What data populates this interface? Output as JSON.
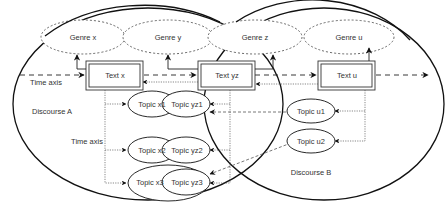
{
  "diagram": {
    "discourses": [
      {
        "id": "A",
        "label": "Discourse A"
      },
      {
        "id": "B",
        "label": "Discourse B"
      }
    ],
    "genres": [
      {
        "id": "x",
        "label": "Genre x"
      },
      {
        "id": "y",
        "label": "Genre y"
      },
      {
        "id": "z",
        "label": "Genre z"
      },
      {
        "id": "u",
        "label": "Genre u"
      }
    ],
    "texts": [
      {
        "id": "x",
        "label": "Text x"
      },
      {
        "id": "yz",
        "label": "Text yz"
      },
      {
        "id": "u",
        "label": "Text u"
      }
    ],
    "topics": [
      {
        "id": "x1",
        "label": "Topic x1"
      },
      {
        "id": "yz1",
        "label": "Topic yz1"
      },
      {
        "id": "x2",
        "label": "Topic x2"
      },
      {
        "id": "yz2",
        "label": "Topic yz2"
      },
      {
        "id": "x3",
        "label": "Topic x3"
      },
      {
        "id": "yz3",
        "label": "Topic yz3"
      },
      {
        "id": "u1",
        "label": "Topic u1"
      },
      {
        "id": "u2",
        "label": "Topic u2"
      }
    ],
    "axis_labels": {
      "time_axis_top": "Time axis",
      "time_axis_topics": "Time axis"
    },
    "colors": {
      "stroke": "#111111",
      "text": "#333333",
      "background": "#ffffff"
    }
  }
}
